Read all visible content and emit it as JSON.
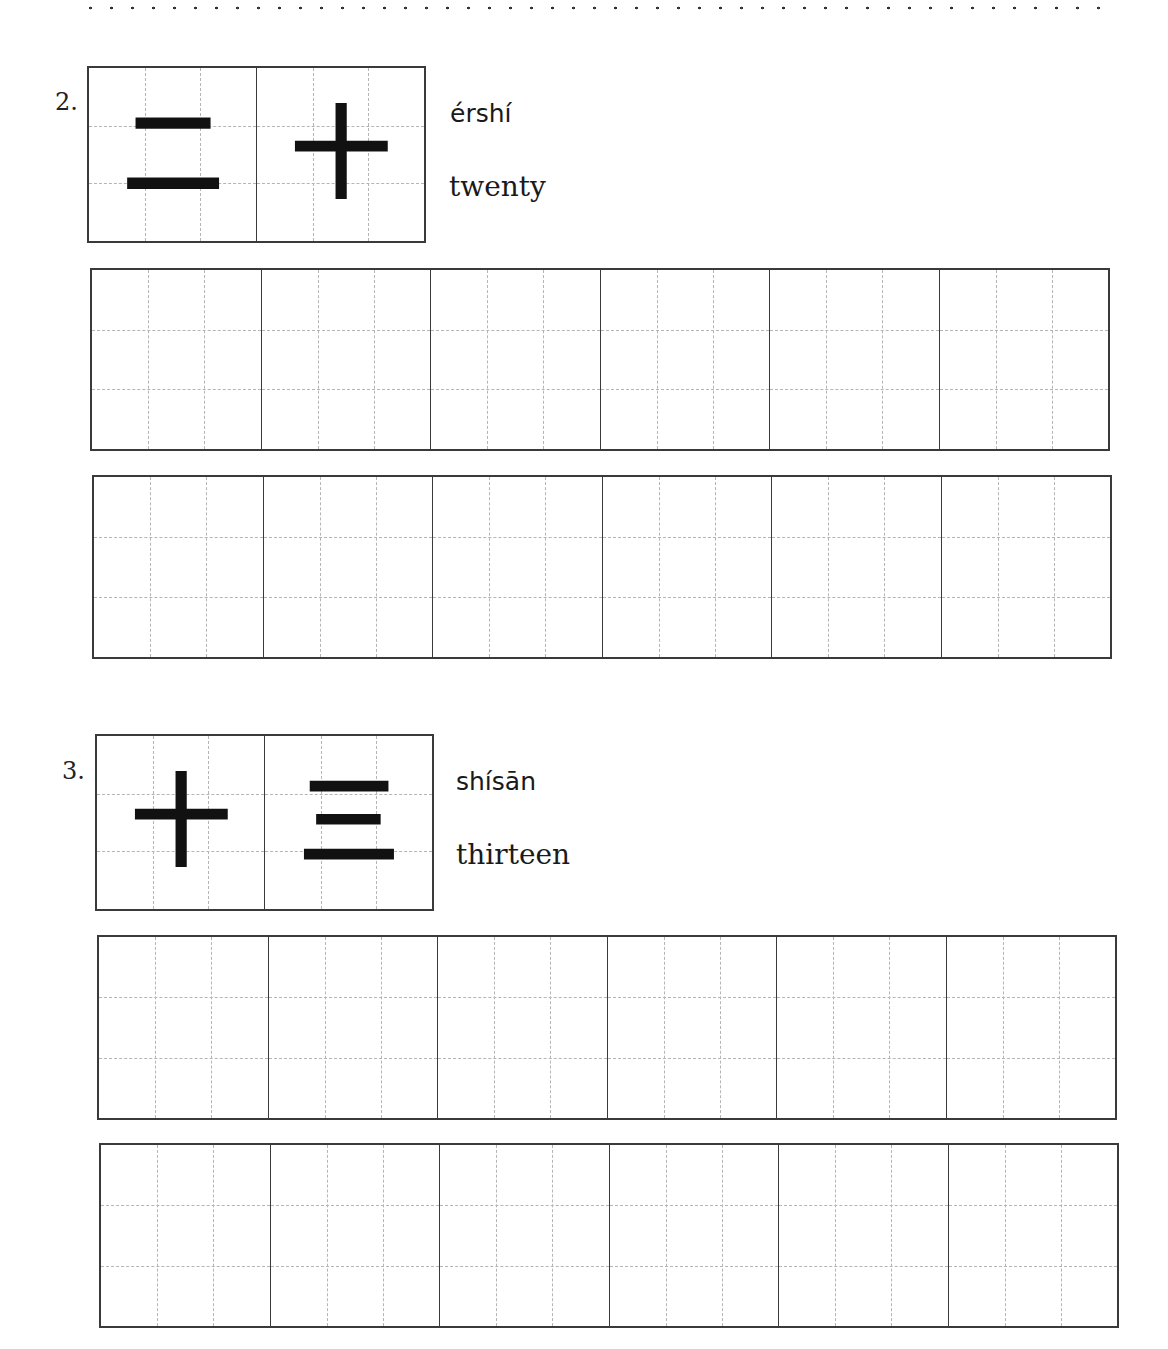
{
  "worksheet": {
    "items": [
      {
        "number": "2.",
        "characters": [
          "二",
          "十"
        ],
        "pinyin": "érshí",
        "meaning": "twenty",
        "practice_rows": 2,
        "cells_per_row": 6
      },
      {
        "number": "3.",
        "characters": [
          "十",
          "三"
        ],
        "pinyin": "shísān",
        "meaning": "thirteen",
        "practice_rows": 2,
        "cells_per_row": 6
      }
    ]
  }
}
